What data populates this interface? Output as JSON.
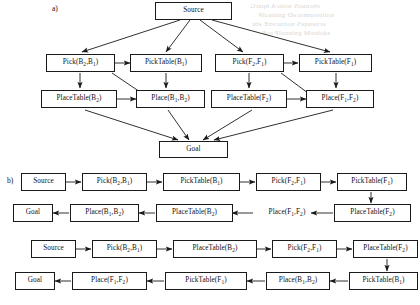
{
  "figure": {
    "panels": [
      {
        "id": "a",
        "label": "a)"
      },
      {
        "id": "b",
        "label": "b)"
      }
    ]
  },
  "panel_a": {
    "label": "a)",
    "nodes": [
      {
        "id": "a-source",
        "text": "Source",
        "base": "Source",
        "sub": ""
      },
      {
        "id": "a-pick-b2b1",
        "text": "Pick(B2,B1)",
        "base": "Pick(B",
        "sub": ""
      },
      {
        "id": "a-picktable-b1",
        "text": "PickTable(B1)",
        "base": "PickTable(B",
        "sub": ""
      },
      {
        "id": "a-pick-f2f1",
        "text": "Pick(F2,F1)",
        "base": "Pick(F",
        "sub": ""
      },
      {
        "id": "a-picktable-f1",
        "text": "PickTable(F1)",
        "base": "PickTable(F",
        "sub": ""
      },
      {
        "id": "a-placetable-b2",
        "text": "PlaceTable(B2)",
        "base": "PlaceTable(B",
        "sub": ""
      },
      {
        "id": "a-place-b1b2",
        "text": "Place(B1,B2)",
        "base": "Place(B",
        "sub": ""
      },
      {
        "id": "a-placetable-f2",
        "text": "PlaceTable(F2)",
        "base": "PlaceTable(F",
        "sub": ""
      },
      {
        "id": "a-place-f1f2",
        "text": "Place(F1,F2)",
        "base": "Place(F",
        "sub": ""
      },
      {
        "id": "a-goal",
        "text": "Goal",
        "base": "Goal",
        "sub": ""
      }
    ]
  },
  "panel_b": {
    "label": "b)",
    "rows": [
      {
        "id": "b-row1",
        "nodes": [
          "Source",
          "Pick(B2,B1)",
          "PickTable(B1)",
          "Pick(F2,F1)",
          "PickTable(F1)"
        ]
      },
      {
        "id": "b-row2",
        "nodes": [
          "Goal",
          "Place(B1,B2)",
          "PlaceTable(B2)",
          "Place(F1,F2)",
          "PlaceTable(F2)"
        ]
      },
      {
        "id": "b-row3",
        "nodes": [
          "Source",
          "Pick(B2,B1)",
          "PlaceTable(B2)",
          "Pick(F2,F1)",
          "PlaceTable(F2)"
        ]
      },
      {
        "id": "b-row4",
        "nodes": [
          "Goal",
          "Place(F1,F2)",
          "PickTable(F1)",
          "Place(B1,B2)",
          "PickTable(B1)"
        ]
      }
    ]
  },
  "labels": {
    "source": "Source",
    "goal": "Goal",
    "pick_b": "Pick(B",
    "pick_f": "Pick(F",
    "picktable_b": "PickTable(B",
    "picktable_f": "PickTable(F",
    "place_b": "Place(B",
    "place_f": "Place(F",
    "placetable_b": "PlaceTable(B",
    "placetable_f": "PlaceTable(F",
    "sub_1": "1",
    "sub_2": "2",
    "comma": ",",
    "close": ")"
  },
  "style": {
    "stroke": "#1a1a1a",
    "background": "#ffffff",
    "text": "#111111"
  }
}
